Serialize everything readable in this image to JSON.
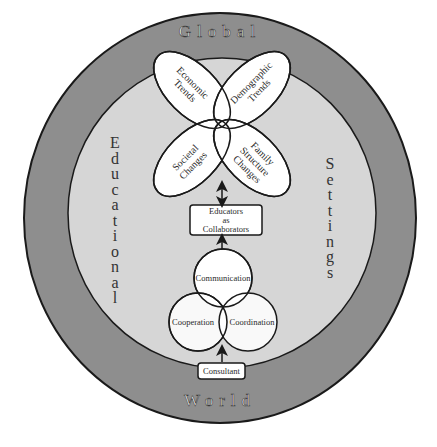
{
  "diagram": {
    "outer_ring": {
      "top_label": "Global",
      "bottom_label": "World",
      "fill": "#8e8e8e",
      "stroke": "#1a1a1a"
    },
    "inner_circle": {
      "left_label": "Educational",
      "right_label": "Settings",
      "fill": "#d6d6d6"
    },
    "petals": [
      {
        "id": "economic",
        "lines": [
          "Economic",
          "Trends"
        ]
      },
      {
        "id": "demographic",
        "lines": [
          "Demographic",
          "Trends"
        ]
      },
      {
        "id": "societal",
        "lines": [
          "Societal",
          "Changes"
        ]
      },
      {
        "id": "family",
        "lines": [
          "Family",
          "Structure",
          "Changes"
        ]
      }
    ],
    "center_box": {
      "lines": [
        "Educators",
        "as",
        "Collaborators"
      ]
    },
    "venn": [
      {
        "id": "communication",
        "label": "Communication"
      },
      {
        "id": "cooperation",
        "label": "Cooperation"
      },
      {
        "id": "coordination",
        "label": "Coordination"
      }
    ],
    "bottom_box": {
      "label": "Consultant"
    },
    "arrows": [
      {
        "from": "petals",
        "to": "center_box",
        "type": "bidirectional"
      },
      {
        "from": "venn",
        "to": "center_box",
        "type": "unidirectional"
      },
      {
        "from": "bottom_box",
        "to": "venn",
        "type": "unidirectional"
      }
    ]
  }
}
